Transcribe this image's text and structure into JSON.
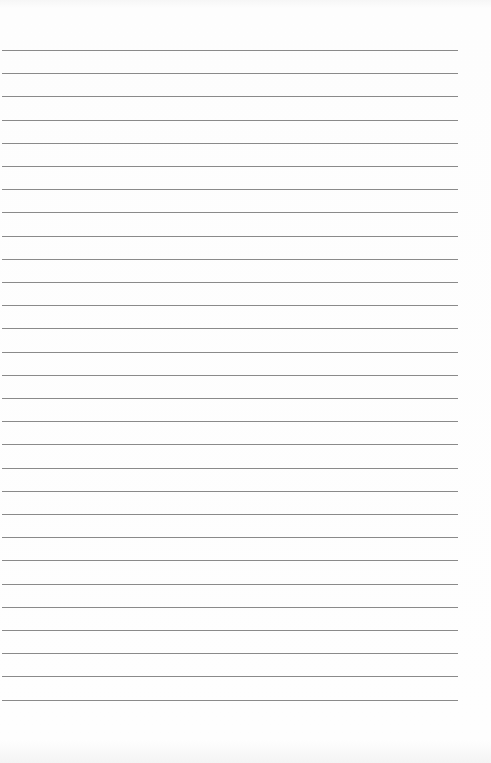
{
  "page": {
    "type": "lined-paper",
    "line_count": 29,
    "first_line_y": 50,
    "line_spacing": 23.2,
    "line_color": "#8a8a8a",
    "background_color": "#fdfdfd"
  }
}
